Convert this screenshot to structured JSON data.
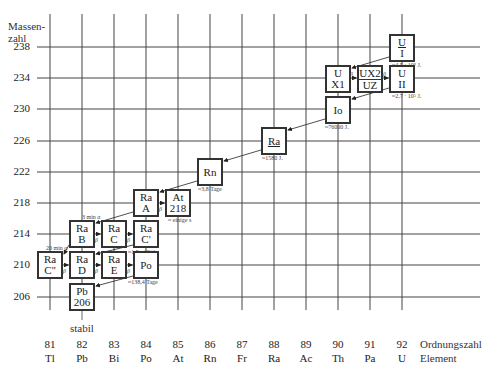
{
  "axes": {
    "y_title_line1": "Massen-",
    "y_title_line2": "zahl",
    "x_title": "Ordnungszahl",
    "x_title2": "Element",
    "y_ticks": [
      "238",
      "234",
      "230",
      "226",
      "222",
      "218",
      "214",
      "210",
      "206"
    ],
    "x_ticks": [
      {
        "z": "81",
        "el": "Tl"
      },
      {
        "z": "82",
        "el": "Pb"
      },
      {
        "z": "83",
        "el": "Bi"
      },
      {
        "z": "84",
        "el": "Po"
      },
      {
        "z": "85",
        "el": "At"
      },
      {
        "z": "86",
        "el": "Rn"
      },
      {
        "z": "87",
        "el": "Fr"
      },
      {
        "z": "88",
        "el": "Ra"
      },
      {
        "z": "89",
        "el": "Ac"
      },
      {
        "z": "90",
        "el": "Th"
      },
      {
        "z": "91",
        "el": "Pa"
      },
      {
        "z": "92",
        "el": "U"
      }
    ]
  },
  "nuclides": {
    "UI": {
      "l1": "U",
      "l2": "I",
      "half_life": "≈4,5 · 10⁹ J."
    },
    "UX1": {
      "l1": "U",
      "l2": "X1"
    },
    "UX2": {
      "l1": "UX2",
      "l2": "UZ"
    },
    "UII": {
      "l1": "U",
      "l2": "II",
      "half_life": "≈2,7 · 10⁵ J."
    },
    "Io": {
      "l1": "Io",
      "half_life": "≈76000 J."
    },
    "Ra": {
      "l1": "Ra",
      "half_life": "≈1580 J."
    },
    "Rn": {
      "l1": "Rn",
      "half_life": "≈3,8 Tage"
    },
    "RaA": {
      "l1": "Ra",
      "l2": "A",
      "half_life": "3 min α"
    },
    "At218": {
      "l1": "At",
      "l2": "218",
      "half_life": "≈ einige s"
    },
    "RaB": {
      "l1": "Ra",
      "l2": "B"
    },
    "RaC": {
      "l1": "Ra",
      "l2": "C"
    },
    "RaC1": {
      "l1": "Ra",
      "l2": "C'",
      "half_life": "≈1,5 · 10⁻⁴ s"
    },
    "RaC2": {
      "l1": "Ra",
      "l2": "C''",
      "half_life": "20 min α"
    },
    "RaD": {
      "l1": "Ra",
      "l2": "D"
    },
    "RaE": {
      "l1": "Ra",
      "l2": "E"
    },
    "Po": {
      "l1": "Po",
      "half_life": "≈138,4 Tage"
    },
    "Pb206": {
      "l1": "Pb",
      "l2": "206",
      "note": "stabil"
    }
  },
  "beta_symbol": "β"
}
